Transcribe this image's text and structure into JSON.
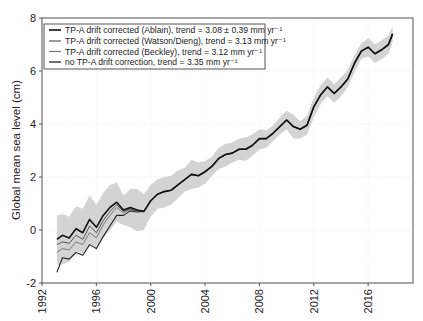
{
  "chart_data": {
    "type": "line",
    "title": "",
    "xlabel": "",
    "ylabel": "Global mean sea level (cm)",
    "xlim": [
      1992,
      2019.3
    ],
    "ylim": [
      -2,
      8
    ],
    "xticks": [
      1992,
      1996,
      2000,
      2004,
      2008,
      2012,
      2016
    ],
    "yticks": [
      -2,
      0,
      2,
      4,
      6,
      8
    ],
    "xtick_labels": [
      "1992",
      "1996",
      "2000",
      "2004",
      "2008",
      "2012",
      "2016"
    ],
    "ytick_labels": [
      "-2",
      "0",
      "2",
      "4",
      "6",
      "8"
    ],
    "grid": true,
    "legend_position": "upper left",
    "uncertainty_band": {
      "label": "uncertainty envelope (Ablain)",
      "color": "#d3d3d3",
      "x": [
        1993.1,
        1993.5,
        1994.0,
        1994.5,
        1995.0,
        1995.5,
        1996.0,
        1996.5,
        1997.0,
        1997.5,
        1998.0,
        1998.5,
        1999.0,
        1999.5,
        2000.0,
        2000.5,
        2001.0,
        2001.5,
        2002.0,
        2002.5,
        2003.0,
        2003.5,
        2004.0,
        2004.5,
        2005.0,
        2005.5,
        2006.0,
        2006.5,
        2007.0,
        2007.5,
        2008.0,
        2008.5,
        2009.0,
        2009.5,
        2010.0,
        2010.5,
        2011.0,
        2011.5,
        2012.0,
        2012.5,
        2013.0,
        2013.5,
        2014.0,
        2014.5,
        2015.0,
        2015.5,
        2016.0,
        2016.5,
        2017.0,
        2017.5,
        2017.8
      ],
      "upper": [
        0.55,
        0.6,
        0.5,
        0.9,
        0.8,
        1.3,
        0.95,
        1.4,
        1.7,
        1.8,
        1.3,
        1.55,
        1.55,
        1.35,
        1.7,
        1.9,
        2.0,
        2.05,
        2.25,
        2.35,
        2.65,
        2.55,
        2.6,
        2.75,
        3.1,
        3.25,
        3.3,
        3.45,
        3.5,
        3.6,
        3.8,
        3.75,
        3.95,
        4.25,
        4.5,
        4.35,
        4.1,
        4.3,
        5.0,
        5.45,
        5.75,
        5.5,
        5.75,
        6.05,
        6.6,
        7.05,
        7.25,
        7.0,
        7.15,
        7.35,
        7.7
      ],
      "lower": [
        -1.3,
        -1.3,
        -1.2,
        -0.8,
        -0.9,
        -0.5,
        -0.75,
        -0.3,
        0.0,
        0.3,
        0.2,
        0.1,
        -0.05,
        0.0,
        0.5,
        0.8,
        0.85,
        0.95,
        1.2,
        1.45,
        1.55,
        1.6,
        1.75,
        2.05,
        2.3,
        2.4,
        2.55,
        2.65,
        2.6,
        2.8,
        3.05,
        3.1,
        3.35,
        3.6,
        3.8,
        3.45,
        3.45,
        3.6,
        4.25,
        4.75,
        5.05,
        4.8,
        5.05,
        5.4,
        5.95,
        6.45,
        6.55,
        6.3,
        6.45,
        6.65,
        7.1
      ]
    },
    "x": [
      1993.1,
      1993.5,
      1994.0,
      1994.5,
      1995.0,
      1995.5,
      1996.0,
      1996.5,
      1997.0,
      1997.5,
      1998.0,
      1998.5,
      1999.0,
      1999.5,
      2000.0,
      2000.5,
      2001.0,
      2001.5,
      2002.0,
      2002.5,
      2003.0,
      2003.5,
      2004.0,
      2004.5,
      2005.0,
      2005.5,
      2006.0,
      2006.5,
      2007.0,
      2007.5,
      2008.0,
      2008.5,
      2009.0,
      2009.5,
      2010.0,
      2010.5,
      2011.0,
      2011.5,
      2012.0,
      2012.5,
      2013.0,
      2013.5,
      2014.0,
      2014.5,
      2015.0,
      2015.5,
      2016.0,
      2016.5,
      2017.0,
      2017.5,
      2017.8
    ],
    "series": [
      {
        "name": "TP-A drift corrected (Ablain), trend = 3.08 ± 0.39 mm yr⁻¹",
        "color": "#111111",
        "width": 1.6,
        "values": [
          -0.35,
          -0.2,
          -0.3,
          0.05,
          -0.1,
          0.4,
          0.1,
          0.55,
          0.85,
          1.05,
          0.75,
          0.85,
          0.75,
          0.7,
          1.1,
          1.35,
          1.45,
          1.5,
          1.7,
          1.9,
          2.1,
          2.05,
          2.2,
          2.4,
          2.7,
          2.85,
          2.9,
          3.05,
          3.05,
          3.2,
          3.45,
          3.45,
          3.65,
          3.9,
          4.15,
          3.9,
          3.8,
          3.95,
          4.65,
          5.1,
          5.4,
          5.15,
          5.4,
          5.7,
          6.3,
          6.75,
          6.9,
          6.65,
          6.8,
          7.0,
          7.4
        ]
      },
      {
        "name": "TP-A drift corrected (Watson/Dieng), trend = 3.13 mm yr⁻¹",
        "color": "#555555",
        "width": 1.0,
        "values": [
          -0.55,
          -0.45,
          -0.5,
          -0.2,
          -0.35,
          0.15,
          -0.1,
          0.35,
          0.7,
          0.95,
          0.7,
          0.8,
          0.72,
          0.7,
          1.1,
          1.35,
          1.45,
          1.5,
          1.7,
          1.9,
          2.1,
          2.05,
          2.2,
          2.4,
          2.7,
          2.85,
          2.9,
          3.05,
          3.05,
          3.2,
          3.45,
          3.45,
          3.65,
          3.9,
          4.15,
          3.9,
          3.8,
          3.95,
          4.65,
          5.1,
          5.4,
          5.15,
          5.4,
          5.7,
          6.3,
          6.75,
          6.9,
          6.65,
          6.8,
          7.0,
          7.4
        ]
      },
      {
        "name": "TP-A drift corrected (Beckley), trend = 3.12 mm yr⁻¹",
        "color": "#7a7a7a",
        "width": 1.0,
        "values": [
          -0.85,
          -0.7,
          -0.75,
          -0.45,
          -0.55,
          -0.1,
          -0.3,
          0.2,
          0.55,
          0.85,
          0.65,
          0.78,
          0.7,
          0.7,
          1.1,
          1.35,
          1.45,
          1.5,
          1.7,
          1.9,
          2.1,
          2.05,
          2.2,
          2.4,
          2.7,
          2.85,
          2.9,
          3.05,
          3.05,
          3.2,
          3.45,
          3.45,
          3.65,
          3.9,
          4.15,
          3.9,
          3.8,
          3.95,
          4.65,
          5.1,
          5.4,
          5.15,
          5.4,
          5.7,
          6.3,
          6.75,
          6.9,
          6.65,
          6.8,
          7.0,
          7.4
        ]
      },
      {
        "name": "no TP-A drift correction, trend = 3.35 mm yr⁻¹",
        "color": "#222222",
        "width": 1.1,
        "values": [
          -1.6,
          -1.05,
          -1.1,
          -0.85,
          -0.95,
          -0.55,
          -0.7,
          -0.25,
          0.15,
          0.55,
          0.55,
          0.72,
          0.68,
          0.7,
          1.1,
          1.35,
          1.45,
          1.5,
          1.7,
          1.9,
          2.1,
          2.05,
          2.2,
          2.4,
          2.7,
          2.85,
          2.9,
          3.05,
          3.05,
          3.2,
          3.45,
          3.45,
          3.65,
          3.9,
          4.15,
          3.9,
          3.8,
          3.95,
          4.65,
          5.1,
          5.4,
          5.15,
          5.4,
          5.7,
          6.3,
          6.75,
          6.9,
          6.65,
          6.8,
          7.0,
          7.4
        ]
      }
    ],
    "legend": [
      "TP-A drift corrected (Ablain), trend = 3.08 ± 0.39 mm yr⁻¹",
      "TP-A drift corrected (Watson/Dieng), trend = 3.13 mm yr⁻¹",
      "TP-A drift corrected (Beckley), trend = 3.12 mm yr⁻¹",
      "no TP-A drift correction, trend = 3.35 mm yr⁻¹"
    ]
  },
  "colors": {
    "band": "#d3d3d3",
    "axis": "#555555",
    "grid": "#e6e6e6"
  }
}
